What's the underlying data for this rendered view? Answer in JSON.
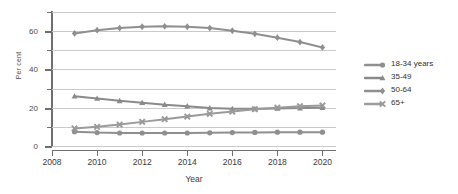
{
  "chart_data": {
    "type": "line",
    "title": "",
    "xlabel": "Year",
    "ylabel": "Per cent",
    "xlim": [
      2008,
      2020.6
    ],
    "ylim": [
      0,
      70
    ],
    "grid": true,
    "legend_position": "right",
    "x": [
      2009,
      2010,
      2011,
      2012,
      2013,
      2014,
      2015,
      2016,
      2017,
      2018,
      2019,
      2020
    ],
    "x_ticks": [
      2008,
      2010,
      2012,
      2014,
      2016,
      2018,
      2020
    ],
    "x_tick_labels": [
      "2008",
      "2010",
      "2012",
      "2014",
      "2016",
      "2018",
      "2020"
    ],
    "y_ticks": [
      0,
      10,
      20,
      30,
      40,
      50,
      60,
      70
    ],
    "y_tick_labels": [
      "0",
      "",
      "20",
      "",
      "40",
      "",
      "60",
      ""
    ],
    "y_major_ticks": [
      0,
      20,
      40,
      60
    ],
    "series": [
      {
        "name": "18-34 years",
        "marker": "circle",
        "color": "#8f8f8f",
        "values": [
          7.5,
          7.0,
          6.8,
          6.8,
          6.8,
          6.8,
          6.9,
          7.0,
          7.1,
          7.2,
          7.2,
          7.2
        ]
      },
      {
        "name": "35-49",
        "marker": "triangle",
        "color": "#8a8a8a",
        "values": [
          26.0,
          24.8,
          23.6,
          22.6,
          21.6,
          20.8,
          19.8,
          19.4,
          19.4,
          19.6,
          19.8,
          20.0
        ]
      },
      {
        "name": "50-64",
        "marker": "diamond",
        "color": "#8f8f8f",
        "values": [
          58.8,
          60.5,
          61.6,
          62.3,
          62.5,
          62.3,
          61.6,
          60.2,
          58.6,
          56.6,
          54.3,
          51.5
        ]
      },
      {
        "name": "65+",
        "marker": "x",
        "color": "#9a9a9a",
        "values": [
          9.2,
          10.0,
          11.2,
          12.6,
          14.0,
          15.4,
          16.8,
          18.0,
          19.2,
          20.0,
          20.8,
          21.2
        ]
      }
    ]
  },
  "legend": {
    "items": [
      {
        "label": "18-34 years",
        "marker": "circle",
        "color": "#8f8f8f"
      },
      {
        "label": "35-49",
        "marker": "triangle",
        "color": "#8a8a8a"
      },
      {
        "label": "50-64",
        "marker": "diamond",
        "color": "#8f8f8f"
      },
      {
        "label": "65+",
        "marker": "x",
        "color": "#9a9a9a"
      }
    ]
  },
  "axes": {
    "y_title": "Per cent",
    "x_title": "Year"
  }
}
